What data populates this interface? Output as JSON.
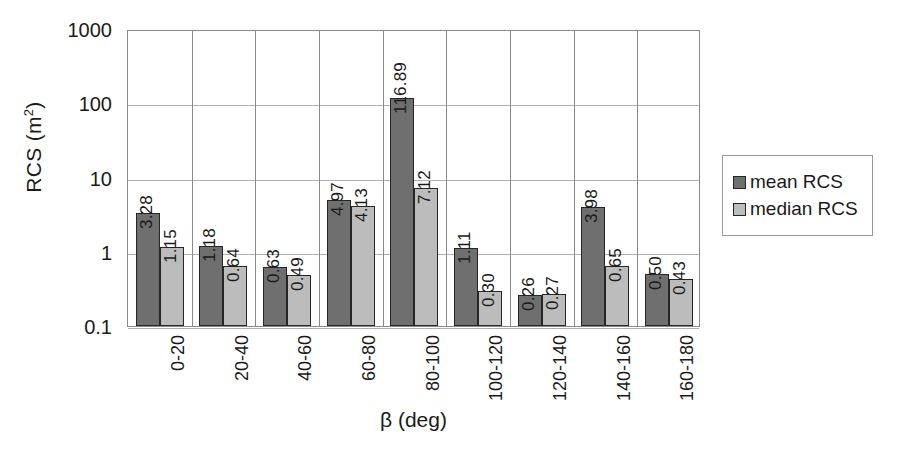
{
  "chart_data": {
    "type": "bar",
    "title": "",
    "xlabel": "β (deg)",
    "ylabel": "RCS (m²)",
    "ylabel_base": "RCS (m",
    "ylabel_sup": "2",
    "ylabel_close": ")",
    "yscale": "log",
    "ylim": [
      0.1,
      1000
    ],
    "ytick_labels": [
      "1000",
      "100",
      "10",
      "1",
      "0.1"
    ],
    "ytick_values": [
      1000,
      100,
      10,
      1,
      0.1
    ],
    "grid": true,
    "legend_position": "right",
    "categories": [
      "0-20",
      "20-40",
      "40-60",
      "60-80",
      "80-100",
      "100-120",
      "120-140",
      "140-160",
      "160-180"
    ],
    "series": [
      {
        "name": "mean RCS",
        "color": "#6f6f6f",
        "values": [
          3.28,
          1.18,
          0.63,
          4.97,
          116.89,
          1.11,
          0.26,
          3.98,
          0.5
        ],
        "labels": [
          "3.28",
          "1.18",
          "0.63",
          "4.97",
          "116.89",
          "1.11",
          "0.26",
          "3.98",
          "0.50"
        ]
      },
      {
        "name": "median RCS",
        "color": "#bcbcbc",
        "values": [
          1.15,
          0.64,
          0.49,
          4.13,
          7.12,
          0.3,
          0.27,
          0.65,
          0.43
        ],
        "labels": [
          "1.15",
          "0.64",
          "0.49",
          "4.13",
          "7.12",
          "0.30",
          "0.27",
          "0.65",
          "0.43"
        ]
      }
    ]
  },
  "legend": {
    "items": [
      {
        "label": "mean RCS",
        "swatch": "mean"
      },
      {
        "label": "median RCS",
        "swatch": "median"
      }
    ]
  }
}
